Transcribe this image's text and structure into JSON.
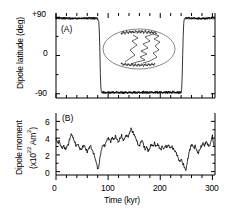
{
  "figure": {
    "background": "#ffffff",
    "line_color": "#000000"
  },
  "panelA": {
    "tag": "(A)",
    "ylabel": "Dipole latitude (deg)",
    "yticks": [
      "+90",
      "0",
      "-90"
    ],
    "inset": {
      "name": "vgp-path-inset",
      "description": "oval projection with VGP path"
    }
  },
  "panelB": {
    "tag": "(B)",
    "ylabel_line1": "Dipole moment",
    "ylabel_line2_pre": "(x10",
    "ylabel_line2_sup": "22",
    "ylabel_line2_mid": " Am",
    "ylabel_line2_sup2": "2",
    "ylabel_line2_post": ")",
    "yticks": [
      "6",
      "4",
      "2",
      "0"
    ]
  },
  "xaxis": {
    "label": "Time (kyr)",
    "ticks": [
      "0",
      "100",
      "200",
      "300"
    ]
  },
  "chart_data": [
    {
      "type": "line",
      "title": "(A) Dipole latitude",
      "xlabel": "Time (kyr)",
      "ylabel": "Dipole latitude (deg)",
      "xlim": [
        0,
        305
      ],
      "ylim": [
        -100,
        100
      ],
      "yticks": [
        90,
        0,
        -90
      ],
      "ytick_labels": [
        "+90",
        "0",
        "-90"
      ],
      "xticks": [
        0,
        100,
        200,
        300
      ],
      "grid": false,
      "legend": null,
      "series": [
        {
          "name": "Dipole latitude",
          "x": [
            0,
            2,
            4,
            6,
            8,
            10,
            12,
            14,
            16,
            18,
            20,
            22,
            24,
            26,
            28,
            30,
            32,
            34,
            36,
            38,
            40,
            42,
            44,
            46,
            48,
            50,
            52,
            54,
            56,
            58,
            60,
            62,
            64,
            66,
            68,
            70,
            72,
            74,
            76,
            78,
            80,
            82,
            83,
            84,
            85,
            86,
            87,
            88,
            90,
            92,
            94,
            96,
            98,
            100,
            102,
            104,
            106,
            108,
            110,
            112,
            114,
            116,
            118,
            120,
            122,
            124,
            126,
            128,
            130,
            132,
            134,
            136,
            138,
            140,
            142,
            144,
            146,
            148,
            150,
            152,
            154,
            156,
            158,
            160,
            162,
            164,
            166,
            168,
            170,
            172,
            174,
            176,
            178,
            180,
            182,
            184,
            186,
            188,
            190,
            192,
            194,
            196,
            198,
            200,
            202,
            204,
            206,
            208,
            210,
            212,
            214,
            216,
            218,
            220,
            222,
            224,
            226,
            228,
            230,
            232,
            234,
            236,
            238,
            240,
            241,
            242,
            243,
            244,
            245,
            246,
            248,
            250,
            252,
            254,
            256,
            258,
            260,
            262,
            264,
            266,
            268,
            270,
            272,
            274,
            276,
            278,
            280,
            282,
            284,
            286,
            288,
            290,
            292,
            294,
            296,
            298,
            300,
            302,
            304
          ],
          "y": [
            89,
            88,
            89,
            87,
            89,
            88,
            86,
            89,
            88,
            87,
            89,
            88,
            86,
            89,
            87,
            88,
            89,
            86,
            88,
            89,
            87,
            89,
            88,
            86,
            89,
            87,
            88,
            89,
            86,
            88,
            87,
            89,
            88,
            86,
            89,
            87,
            88,
            86,
            89,
            87,
            85,
            80,
            60,
            20,
            -40,
            -75,
            -85,
            -88,
            -86,
            -88,
            -87,
            -89,
            -86,
            -88,
            -85,
            -89,
            -87,
            -88,
            -86,
            -89,
            -87,
            -85,
            -88,
            -86,
            -89,
            -87,
            -88,
            -85,
            -89,
            -86,
            -88,
            -87,
            -89,
            -85,
            -88,
            -86,
            -89,
            -87,
            -84,
            -88,
            -86,
            -89,
            -87,
            -85,
            -88,
            -86,
            -89,
            -83,
            -87,
            -85,
            -88,
            -86,
            -89,
            -84,
            -87,
            -85,
            -88,
            -86,
            -89,
            -87,
            -84,
            -88,
            -86,
            -89,
            -85,
            -87,
            -88,
            -86,
            -89,
            -84,
            -87,
            -85,
            -88,
            -86,
            -89,
            -83,
            -87,
            -85,
            -88,
            -86,
            -89,
            -87,
            -84,
            -88,
            -80,
            -50,
            0,
            45,
            75,
            86,
            88,
            89,
            87,
            89,
            88,
            86,
            89,
            87,
            88,
            89,
            86,
            88,
            87,
            89,
            88,
            86,
            89,
            87,
            88,
            86,
            89,
            87,
            88,
            89
          ]
        }
      ],
      "inset": {
        "type": "vgp-path-oval",
        "description": "Mollweide-like oval with virtual geomagnetic pole path; dense dark clusters at top and bottom of oval"
      }
    },
    {
      "type": "line",
      "title": "(B) Dipole moment",
      "xlabel": "Time (kyr)",
      "ylabel": "Dipole moment (x10^22 Am^2)",
      "xlim": [
        0,
        305
      ],
      "ylim": [
        -0.4,
        7
      ],
      "yticks": [
        0,
        2,
        4,
        6
      ],
      "xticks": [
        0,
        100,
        200,
        300
      ],
      "grid": false,
      "legend": null,
      "series": [
        {
          "name": "Dipole moment",
          "x": [
            0,
            3,
            6,
            9,
            12,
            15,
            18,
            21,
            24,
            27,
            30,
            33,
            36,
            39,
            42,
            45,
            48,
            51,
            54,
            57,
            60,
            63,
            66,
            69,
            72,
            75,
            78,
            81,
            84,
            87,
            90,
            93,
            96,
            99,
            102,
            105,
            108,
            111,
            114,
            117,
            120,
            123,
            126,
            129,
            132,
            135,
            138,
            141,
            144,
            147,
            150,
            153,
            156,
            159,
            162,
            165,
            168,
            171,
            174,
            177,
            180,
            183,
            186,
            189,
            192,
            195,
            198,
            201,
            204,
            207,
            210,
            213,
            216,
            219,
            222,
            225,
            228,
            231,
            234,
            237,
            240,
            243,
            246,
            249,
            252,
            255,
            258,
            261,
            264,
            267,
            270,
            273,
            276,
            279,
            282,
            285,
            288,
            291,
            294,
            297,
            300,
            303
          ],
          "y": [
            4.0,
            3.4,
            3.7,
            3.1,
            2.8,
            3.1,
            2.6,
            3.0,
            3.3,
            4.1,
            4.5,
            4.0,
            3.5,
            3.1,
            3.3,
            2.8,
            2.6,
            2.9,
            3.2,
            2.7,
            2.4,
            2.8,
            3.1,
            2.6,
            2.2,
            1.6,
            0.9,
            0.2,
            1.5,
            2.6,
            3.2,
            3.0,
            3.5,
            4.0,
            3.9,
            3.6,
            4.1,
            3.8,
            4.2,
            3.9,
            3.5,
            4.0,
            4.3,
            3.7,
            4.0,
            4.4,
            4.1,
            4.6,
            5.1,
            4.7,
            4.4,
            4.0,
            3.5,
            3.0,
            3.4,
            3.8,
            3.2,
            2.6,
            3.0,
            2.4,
            2.8,
            3.3,
            3.0,
            3.4,
            3.0,
            3.3,
            2.9,
            2.6,
            3.0,
            2.7,
            3.1,
            2.9,
            3.2,
            2.8,
            3.0,
            2.7,
            2.5,
            2.2,
            1.7,
            1.2,
            1.5,
            1.0,
            0.6,
            0.1,
            1.2,
            2.2,
            2.9,
            3.3,
            2.8,
            3.1,
            2.5,
            2.2,
            2.7,
            3.0,
            3.4,
            3.1,
            3.6,
            3.3,
            3.0,
            3.5,
            4.2,
            3.1
          ]
        }
      ]
    }
  ]
}
